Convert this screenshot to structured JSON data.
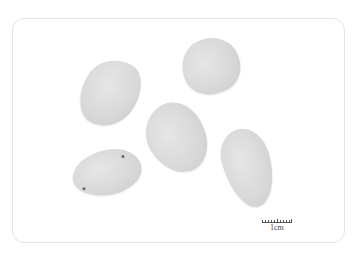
{
  "image": {
    "description": "Five teardrop-shaped light grey seeds photographed on a white background with a scale bar",
    "seed_count": 5,
    "background_color": "#ffffff",
    "seed_color": "#d9d9d9"
  },
  "scale_bar": {
    "label": "1cm"
  }
}
